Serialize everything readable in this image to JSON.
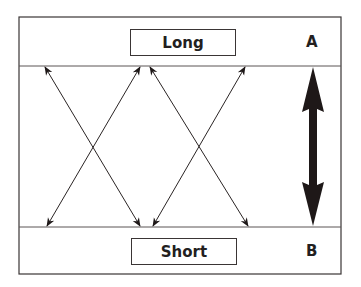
{
  "diagram": {
    "top_label": "Long",
    "bottom_label": "Short",
    "top_marker": "A",
    "bottom_marker": "B",
    "colors": {
      "stroke": "#3a3535",
      "arrow_fill": "#1e1818",
      "text": "#231f1f",
      "background": "#ffffff"
    },
    "arrows": [
      {
        "from": "Long",
        "to": "Short",
        "type": "double-headed-thin",
        "count": 4
      },
      {
        "from": "A",
        "to": "B",
        "type": "double-headed-thick",
        "count": 1
      }
    ]
  }
}
